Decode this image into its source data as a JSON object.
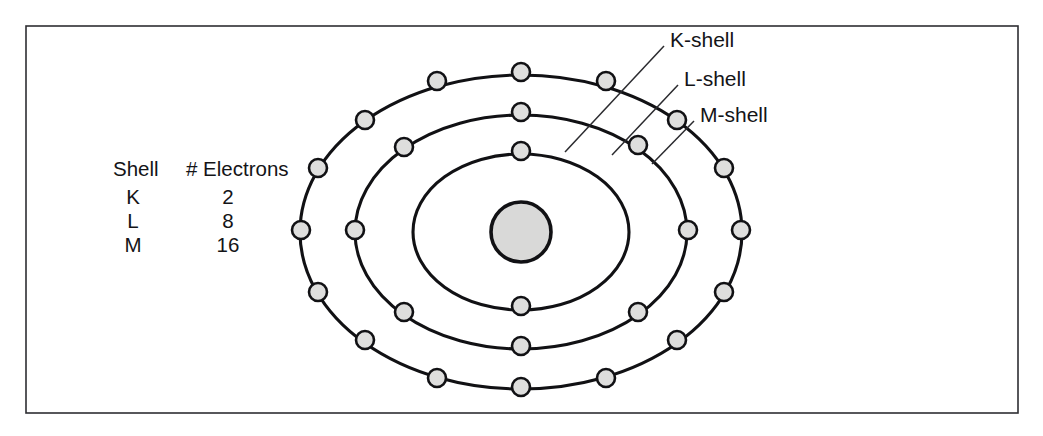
{
  "figure": {
    "frame": {
      "x": 26,
      "y": 26,
      "width": 992,
      "height": 387
    },
    "background_color": "#ffffff",
    "line_color": "#111114",
    "electron_fill": "#dededd",
    "nucleus_fill": "#d9d9d8"
  },
  "nucleus": {
    "name": "nucleus",
    "cx": 521,
    "cy": 232,
    "r": 30
  },
  "legend": {
    "headers": {
      "shell": "Shell",
      "electrons": "# Electrons"
    },
    "rows": [
      {
        "shell": "K",
        "electrons": "2"
      },
      {
        "shell": "L",
        "electrons": "8"
      },
      {
        "shell": "M",
        "electrons": "16"
      }
    ]
  },
  "callouts": [
    {
      "label": "K-shell",
      "text_x": 670,
      "text_y": 41,
      "line": {
        "x1": 664,
        "y1": 46,
        "x2": 565,
        "y2": 152
      }
    },
    {
      "label": "L-shell",
      "text_x": 684,
      "text_y": 80,
      "line": {
        "x1": 678,
        "y1": 85,
        "x2": 612,
        "y2": 155
      }
    },
    {
      "label": "M-shell",
      "text_x": 700,
      "text_y": 116,
      "line": {
        "x1": 694,
        "y1": 121,
        "x2": 652,
        "y2": 164
      }
    }
  ],
  "shells": [
    {
      "name": "K-shell",
      "id": "k",
      "electron_count": 2,
      "rx": 108,
      "ry": 78,
      "electrons": [
        {
          "cx": 521,
          "cy": 151
        },
        {
          "cx": 521,
          "cy": 306
        }
      ]
    },
    {
      "name": "L-shell",
      "id": "l",
      "electron_count": 8,
      "rx": 166,
      "ry": 117,
      "electrons": [
        {
          "cx": 521,
          "cy": 112
        },
        {
          "cx": 638,
          "cy": 145
        },
        {
          "cx": 688,
          "cy": 230
        },
        {
          "cx": 638,
          "cy": 312
        },
        {
          "cx": 521,
          "cy": 346
        },
        {
          "cx": 404,
          "cy": 312
        },
        {
          "cx": 355,
          "cy": 230
        },
        {
          "cx": 404,
          "cy": 147
        }
      ]
    },
    {
      "name": "M-shell",
      "id": "m",
      "electron_count": 16,
      "rx": 221,
      "ry": 157,
      "electrons": [
        {
          "cx": 521,
          "cy": 72
        },
        {
          "cx": 606,
          "cy": 81
        },
        {
          "cx": 677,
          "cy": 120
        },
        {
          "cx": 724,
          "cy": 168
        },
        {
          "cx": 741,
          "cy": 230
        },
        {
          "cx": 724,
          "cy": 292
        },
        {
          "cx": 677,
          "cy": 340
        },
        {
          "cx": 606,
          "cy": 378
        },
        {
          "cx": 521,
          "cy": 387
        },
        {
          "cx": 437,
          "cy": 378
        },
        {
          "cx": 365,
          "cy": 340
        },
        {
          "cx": 318,
          "cy": 292
        },
        {
          "cx": 301,
          "cy": 230
        },
        {
          "cx": 318,
          "cy": 168
        },
        {
          "cx": 365,
          "cy": 120
        },
        {
          "cx": 437,
          "cy": 81
        }
      ]
    }
  ],
  "legend_layout": {
    "header_shell_x": 113,
    "header_electrons_x": 186,
    "header_y": 176,
    "col_shell_center_x": 133,
    "col_electrons_center_x": 228,
    "row_y": [
      204,
      228,
      252
    ]
  }
}
